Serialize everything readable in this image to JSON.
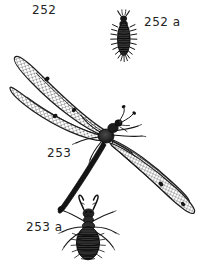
{
  "plate": {
    "title": "Antlion and larvae illustration plate",
    "background_color": "#ffffff",
    "ink_color": "#1a1a1a",
    "label_color": "#242424",
    "width": 204,
    "height": 261
  },
  "figures": [
    {
      "id": "252",
      "label": "252",
      "subject": "myrmeleontid-larva-figure-number",
      "kind": "figure-number"
    },
    {
      "id": "252a",
      "label": "252 a",
      "subject": "elongate-bristly-larva",
      "kind": "specimen-larva",
      "description": "small dark elongate segmented larva with lateral bristles and forward mandibles"
    },
    {
      "id": "253",
      "label": "253",
      "subject": "adult-antlion",
      "kind": "specimen-adult",
      "description": "adult antlion with four long net-veined wings, slender abdomen, clubbed antennae"
    },
    {
      "id": "253a",
      "label": "253 a",
      "subject": "antlion-larva",
      "kind": "specimen-larva",
      "description": "broad segmented antlion larva with large curved sickle mandibles and six legs"
    }
  ],
  "adult": {
    "wing_spot_count": 4,
    "wing_count": 4,
    "leg_count": 6,
    "antenna_count": 2
  }
}
